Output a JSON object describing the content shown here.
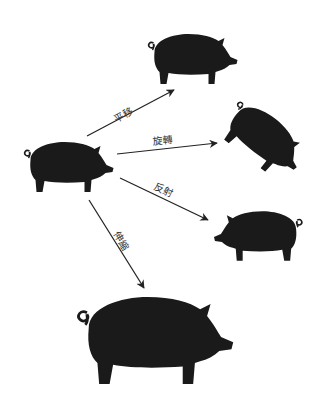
{
  "diagram": {
    "colors": {
      "figure": "#1a1a1a",
      "arrow": "#222222",
      "label": "#333333",
      "background": "#ffffff"
    },
    "source": {
      "name": "original-pig",
      "x": 22,
      "y": 138
    },
    "transformations": [
      {
        "id": "translation",
        "label": "平移",
        "meaning": "translation"
      },
      {
        "id": "rotation",
        "label": "旋轉",
        "meaning": "rotation"
      },
      {
        "id": "reflection",
        "label": "反射",
        "meaning": "reflection"
      },
      {
        "id": "dilation",
        "label": "伸縮",
        "meaning": "dilation"
      }
    ]
  }
}
